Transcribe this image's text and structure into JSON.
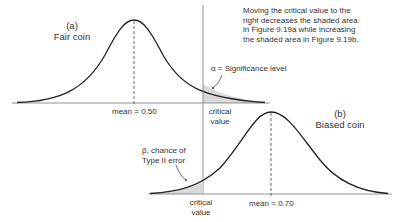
{
  "figure": {
    "note": [
      "Moving the critical value to the",
      "right decreases the shaded area",
      "in Figure 9.19a while increasing",
      "the shaded area in Figure 9.19b."
    ],
    "panel_a": {
      "letter": "(a)",
      "title": "Fair coin",
      "mean_label": "mean = 0.50",
      "critical_label": [
        "critical",
        "value"
      ],
      "alpha_label": "α = Significance level"
    },
    "panel_b": {
      "letter": "(b)",
      "title": "Biased coin",
      "mean_label": "mean = 0.70",
      "critical_label": [
        "critical",
        "value"
      ],
      "beta_label": [
        "β, chance of",
        "Type II error"
      ]
    },
    "colors": {
      "curve": "#222222",
      "axis": "#666666",
      "shade": "#d9d9d9",
      "text": "#333333"
    }
  }
}
